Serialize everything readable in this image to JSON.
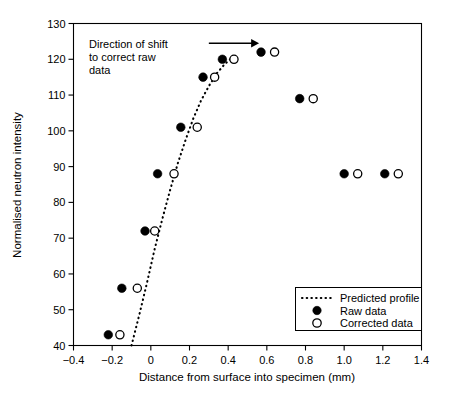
{
  "chart_data": {
    "type": "scatter",
    "title": "",
    "xlabel": "Distance from surface into specimen (mm)",
    "ylabel": "Normalised neutron intensity",
    "xlim": [
      -0.4,
      1.4
    ],
    "ylim": [
      40,
      130
    ],
    "xticks": [
      -0.4,
      -0.2,
      0,
      0.2,
      0.4,
      0.6,
      0.8,
      1.0,
      1.2,
      1.4
    ],
    "xtick_labels": [
      "-0.4",
      "-0.2",
      "0",
      "0.2",
      "0.4",
      "0.6",
      "0.8",
      "1.0",
      "1.2",
      "1.4"
    ],
    "yticks": [
      40,
      50,
      60,
      70,
      80,
      90,
      100,
      110,
      120,
      130
    ],
    "ytick_labels": [
      "40",
      "50",
      "60",
      "70",
      "80",
      "90",
      "100",
      "110",
      "120",
      "130"
    ],
    "grid": false,
    "legend_position": "lower right",
    "series": [
      {
        "name": "Predicted profile",
        "marker": "none",
        "linestyle": "dotted",
        "x": [
          -0.1,
          -0.06,
          -0.02,
          0.02,
          0.06,
          0.1,
          0.14,
          0.18,
          0.22,
          0.26,
          0.3,
          0.34,
          0.38,
          0.42
        ],
        "y": [
          40.0,
          48.5,
          57.5,
          67.0,
          75.5,
          83.5,
          91.0,
          97.5,
          103.5,
          108.5,
          112.5,
          116.0,
          118.5,
          120.5
        ]
      },
      {
        "name": "Raw data",
        "marker": "filled-circle",
        "x": [
          -0.22,
          -0.15,
          -0.03,
          0.035,
          0.155,
          0.27,
          0.37,
          0.57,
          0.77,
          1.0,
          1.21
        ],
        "y": [
          43,
          56,
          72,
          88,
          101,
          115,
          120,
          122,
          109,
          88,
          88
        ]
      },
      {
        "name": "Corrected data",
        "marker": "open-circle",
        "x": [
          -0.16,
          -0.07,
          0.02,
          0.12,
          0.24,
          0.33,
          0.43,
          0.64,
          0.84,
          1.07,
          1.28
        ],
        "y": [
          43,
          56,
          72,
          88,
          101,
          115,
          120,
          122,
          109,
          88,
          88
        ]
      }
    ],
    "annotations": [
      {
        "name": "direction-of-shift-note",
        "lines": [
          "Direction of shift",
          "to correct raw",
          "data"
        ],
        "arrow": {
          "from_x": 0.3,
          "from_y": 124.5,
          "to_x": 0.56,
          "to_y": 124.5
        }
      }
    ],
    "legend_entries": [
      {
        "label": "Predicted profile",
        "marker": "dotted-line"
      },
      {
        "label": "Raw data",
        "marker": "filled-circle"
      },
      {
        "label": "Corrected data",
        "marker": "open-circle"
      }
    ],
    "colors": {
      "foreground": "#000000",
      "background": "#ffffff",
      "raw_marker_fill": "#000000",
      "corrected_marker_fill": "#ffffff"
    }
  }
}
